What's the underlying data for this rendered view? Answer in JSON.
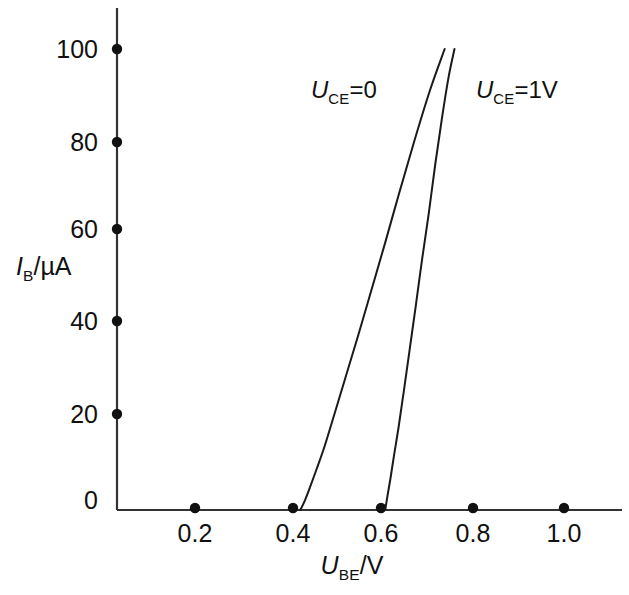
{
  "chart_data": {
    "type": "line",
    "title": "",
    "subtitle": "",
    "xlabel_parts": {
      "var": "U",
      "sub": "BE",
      "unit": "/V"
    },
    "ylabel_parts": {
      "var": "I",
      "sub": "B",
      "unit": "/µA"
    },
    "xlabel": "U_BE/V",
    "ylabel": "I_B/µA",
    "xlim": [
      0,
      1.1
    ],
    "ylim": [
      0,
      108
    ],
    "grid": false,
    "legend_position": "inline-annotations",
    "x_ticks": [
      {
        "value": 0.2,
        "label": "0.2"
      },
      {
        "value": 0.4,
        "label": "0.4"
      },
      {
        "value": 0.6,
        "label": "0.6"
      },
      {
        "value": 0.8,
        "label": "0.8"
      },
      {
        "value": 1.0,
        "label": "1.0"
      }
    ],
    "y_ticks": [
      {
        "value": 0,
        "label": "0"
      },
      {
        "value": 20,
        "label": "20"
      },
      {
        "value": 40,
        "label": "40"
      },
      {
        "value": 60,
        "label": "60"
      },
      {
        "value": 80,
        "label": "80"
      },
      {
        "value": 100,
        "label": "100"
      }
    ],
    "series": [
      {
        "name": "U_CE=0",
        "annotation": {
          "var": "U",
          "sub": "CE",
          "rest": "=0"
        },
        "color": "#1a1a1a",
        "x": [
          0.41,
          0.42,
          0.432,
          0.447,
          0.465,
          0.487,
          0.512,
          0.54,
          0.57,
          0.6,
          0.632,
          0.665,
          0.7,
          0.733
        ],
        "y": [
          0,
          2,
          5,
          9,
          14,
          21,
          29,
          38,
          48,
          58,
          69,
          80,
          91,
          100
        ]
      },
      {
        "name": "U_CE=1V",
        "annotation": {
          "var": "U",
          "sub": "CE",
          "rest": "=1V"
        },
        "color": "#1a1a1a",
        "x": [
          0.6,
          0.605,
          0.612,
          0.62,
          0.63,
          0.642,
          0.655,
          0.668,
          0.682,
          0.697,
          0.712,
          0.727,
          0.742,
          0.755
        ],
        "y": [
          0,
          3,
          7,
          12,
          18,
          26,
          35,
          44,
          54,
          64,
          75,
          85,
          94,
          100
        ]
      }
    ],
    "annotations": [
      {
        "text": "U_CE=0",
        "x": 0.54,
        "y": 91
      },
      {
        "text": "U_CE=1V",
        "x": 0.93,
        "y": 91
      }
    ]
  },
  "axes": {
    "tick_marker_style": "filled-dot",
    "axis_color": "#333333",
    "curve_color": "#1a1a1a"
  }
}
